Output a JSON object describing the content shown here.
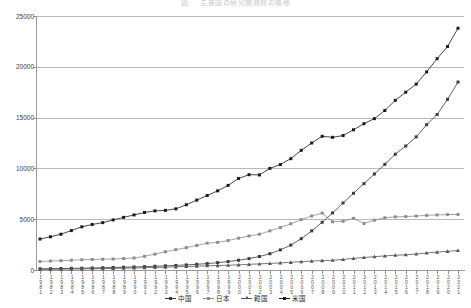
{
  "chart": {
    "title": "図 　 主要国の研究開発費の推移",
    "type": "line"
  },
  "legend": {
    "position": "bottom-center",
    "items": [
      {
        "label": "中国",
        "color": "#3b3b3b",
        "marker": "square"
      },
      {
        "label": "日本",
        "color": "#8d8d8d",
        "marker": "square"
      },
      {
        "label": "韓国",
        "color": "#555555",
        "marker": "triangle"
      },
      {
        "label": "米国",
        "color": "#1a1a1a",
        "marker": "square"
      }
    ]
  },
  "axes": {
    "y": {
      "ticks": [
        "0",
        "5000",
        "10000",
        "15000",
        "20000",
        "25000"
      ],
      "values": [
        0,
        5000,
        10000,
        15000,
        20000,
        25000
      ],
      "min": 0,
      "max": 25000,
      "label": ""
    },
    "x": {
      "label": "",
      "tick_labels": [
        "1981",
        "1982",
        "1983",
        "1984",
        "1985",
        "1986",
        "1987",
        "1988",
        "1989",
        "1990",
        "1991",
        "1992",
        "1993",
        "1994",
        "1995",
        "1996",
        "1997",
        "1998",
        "1999",
        "2000",
        "2001",
        "2002",
        "2003",
        "2004",
        "2005",
        "2006",
        "2007",
        "2008",
        "2009",
        "2010",
        "2011",
        "2012",
        "2013",
        "2014",
        "2015",
        "2016",
        "2017",
        "2018",
        "2019",
        "2020",
        "2021"
      ]
    }
  },
  "chart_data": {
    "type": "line",
    "title": "図 　 主要国の研究開発費の推移",
    "xlabel": "",
    "ylabel": "",
    "ylim": [
      0,
      25000
    ],
    "grid": true,
    "legend_position": "bottom-center",
    "x": [
      "1981",
      "1982",
      "1983",
      "1984",
      "1985",
      "1986",
      "1987",
      "1988",
      "1989",
      "1990",
      "1991",
      "1992",
      "1993",
      "1994",
      "1995",
      "1996",
      "1997",
      "1998",
      "1999",
      "2000",
      "2001",
      "2002",
      "2003",
      "2004",
      "2005",
      "2006",
      "2007",
      "2008",
      "2009",
      "2010",
      "2011",
      "2012",
      "2013",
      "2014",
      "2015",
      "2016",
      "2017",
      "2018",
      "2019",
      "2020",
      "2021"
    ],
    "series": [
      {
        "name": "米国",
        "color": "#1a1a1a",
        "values": [
          3050,
          3270,
          3520,
          3880,
          4250,
          4480,
          4660,
          4930,
          5180,
          5420,
          5660,
          5820,
          5870,
          6020,
          6420,
          6880,
          7330,
          7790,
          8330,
          9010,
          9380,
          9360,
          10000,
          10380,
          10960,
          11780,
          12500,
          13160,
          13060,
          13230,
          13800,
          14400,
          14900,
          15700,
          16700,
          17500,
          18300,
          19500,
          20800,
          22000,
          23800
        ]
      },
      {
        "name": "日本",
        "color": "#8d8d8d",
        "values": [
          830,
          880,
          920,
          960,
          1010,
          1040,
          1060,
          1080,
          1120,
          1180,
          1350,
          1560,
          1800,
          2000,
          2200,
          2420,
          2640,
          2720,
          2900,
          3130,
          3350,
          3520,
          3850,
          4180,
          4550,
          4960,
          5320,
          5600,
          4740,
          4800,
          5080,
          4580,
          4900,
          5140,
          5230,
          5260,
          5310,
          5380,
          5420,
          5450,
          5470
        ]
      },
      {
        "name": "中国",
        "color": "#3b3b3b",
        "values": [
          120,
          130,
          145,
          160,
          180,
          200,
          225,
          250,
          275,
          300,
          330,
          370,
          410,
          450,
          500,
          560,
          630,
          720,
          830,
          960,
          1120,
          1330,
          1600,
          1980,
          2450,
          3080,
          3850,
          4700,
          5620,
          6600,
          7550,
          8500,
          9450,
          10400,
          11400,
          12200,
          13100,
          14300,
          15300,
          16800,
          18500
        ]
      },
      {
        "name": "韓国",
        "color": "#555555",
        "values": [
          60,
          70,
          80,
          95,
          110,
          125,
          140,
          160,
          180,
          200,
          225,
          250,
          280,
          310,
          345,
          380,
          420,
          440,
          470,
          510,
          560,
          600,
          650,
          700,
          760,
          820,
          880,
          930,
          960,
          1040,
          1140,
          1230,
          1310,
          1390,
          1450,
          1500,
          1580,
          1680,
          1760,
          1840,
          1920
        ]
      }
    ]
  }
}
